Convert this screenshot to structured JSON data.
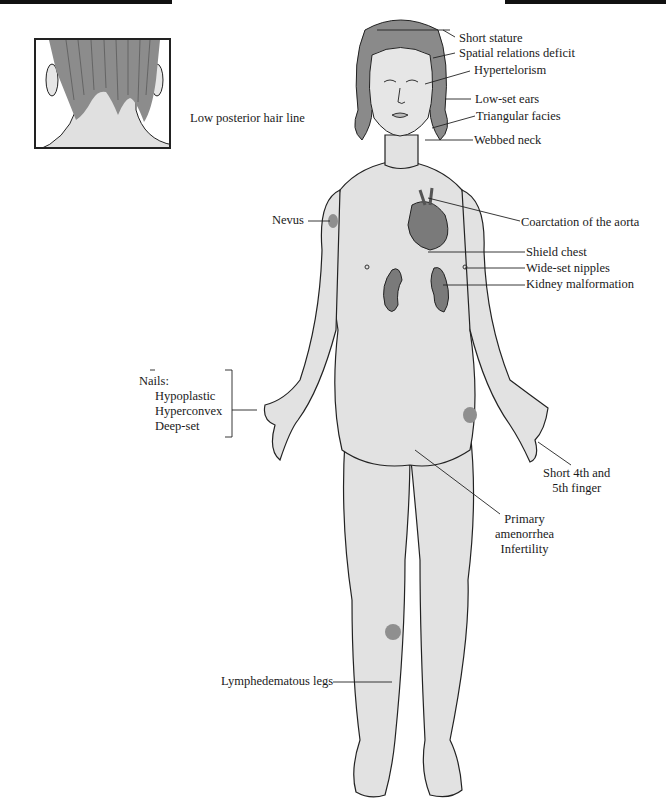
{
  "figure": {
    "colors": {
      "skin": "#e2e2e2",
      "skin_shadow": "#cfcfcf",
      "hair": "#8a8a8a",
      "organ": "#7a7a7a",
      "nevus": "#8f8f8f",
      "outline": "#222222",
      "header_bar": "#111111"
    }
  },
  "inset": {
    "label": "Low posterior hair line"
  },
  "labels": {
    "short_stature": "Short stature",
    "spatial_relations_deficit": "Spatial relations deficit",
    "hypertelorism": "Hypertelorism",
    "low_set_ears": "Low-set ears",
    "triangular_facies": "Triangular facies",
    "webbed_neck": "Webbed neck",
    "nevus": "Nevus",
    "coarctation": "Coarctation of the aorta",
    "shield_chest": "Shield chest",
    "wide_set_nipples": "Wide-set nipples",
    "kidney_malformation": "Kidney malformation",
    "nails": {
      "title": "Nails:",
      "items": [
        "Hypoplastic",
        "Hyperconvex",
        "Deep-set"
      ]
    },
    "short_fingers": [
      "Short 4th and",
      "5th finger"
    ],
    "amenorrhea": [
      "Primary",
      "amenorrhea",
      "Infertility"
    ],
    "lymphedematous_legs": "Lymphedematous legs"
  }
}
